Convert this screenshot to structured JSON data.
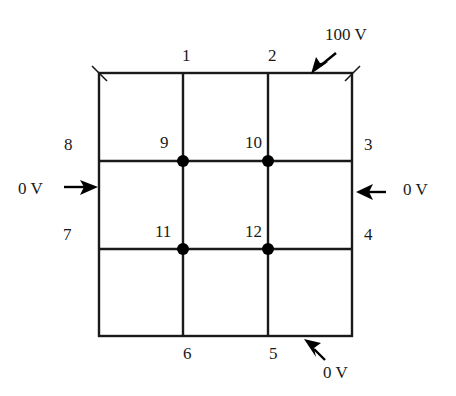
{
  "diagram": {
    "type": "finite-difference-grid",
    "grid": {
      "rows": 3,
      "cols": 3,
      "line_color": "#1a1a1a",
      "node_color": "#000000"
    },
    "boundary_labels": {
      "n1": "1",
      "n2": "2",
      "n3": "3",
      "n4": "4",
      "n5": "5",
      "n6": "6",
      "n7": "7",
      "n8": "8"
    },
    "interior_nodes": {
      "n9": "9",
      "n10": "10",
      "n11": "11",
      "n12": "12"
    },
    "potentials": {
      "top": "100 V",
      "left": "0 V",
      "right": "0 V",
      "bottom": "0 V"
    }
  }
}
